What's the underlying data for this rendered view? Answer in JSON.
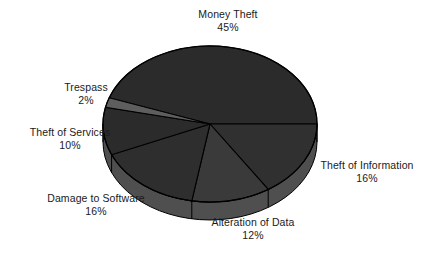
{
  "chart_data": {
    "type": "pie",
    "title": "",
    "subtitle": "",
    "xlabel": "",
    "ylabel": "",
    "legend_position": "none",
    "grid": false,
    "three_d": true,
    "units": "percent",
    "categories": [
      "Money Theft",
      "Theft of Information",
      "Alteration of Data",
      "Damage to Software",
      "Theft of Services",
      "Trespass"
    ],
    "values": [
      45,
      16,
      12,
      16,
      10,
      2
    ],
    "slices": [
      {
        "label": "Money Theft",
        "value": 45,
        "pct_text": "45%",
        "color": "#2b2b2b",
        "side_color": "#4c4c4c"
      },
      {
        "label": "Theft of Information",
        "value": 16,
        "pct_text": "16%",
        "color": "#303030",
        "side_color": "#525252"
      },
      {
        "label": "Alteration of Data",
        "value": 12,
        "pct_text": "12%",
        "color": "#3a3a3a",
        "side_color": "#5c5c5c"
      },
      {
        "label": "Damage to Software",
        "value": 16,
        "pct_text": "16%",
        "color": "#2e2e2e",
        "side_color": "#505050"
      },
      {
        "label": "Theft of Services",
        "value": 10,
        "pct_text": "10%",
        "color": "#2b2b2b",
        "side_color": "#4c4c4c"
      },
      {
        "label": "Trespass",
        "value": 2,
        "pct_text": "2%",
        "color": "#5e5e5e",
        "side_color": "#6e6e6e"
      }
    ]
  },
  "labels": {
    "money_theft": {
      "name": "Money Theft",
      "pct": "45%"
    },
    "theft_of_information": {
      "name": "Theft of Information",
      "pct": "16%"
    },
    "alteration_of_data": {
      "name": "Alteration of Data",
      "pct": "12%"
    },
    "damage_to_software": {
      "name": "Damage to Software",
      "pct": "16%"
    },
    "theft_of_services": {
      "name": "Theft of Services",
      "pct": "10%"
    },
    "trespass": {
      "name": "Trespass",
      "pct": "2%"
    }
  },
  "colors": {
    "background": "#ffffff",
    "text": "#1a1a1a",
    "outline": "#000000",
    "slice_dark": "#2b2b2b",
    "slice_mid": "#3a3a3a",
    "slice_light": "#5e5e5e",
    "side_wall": "#4f4f4f"
  }
}
